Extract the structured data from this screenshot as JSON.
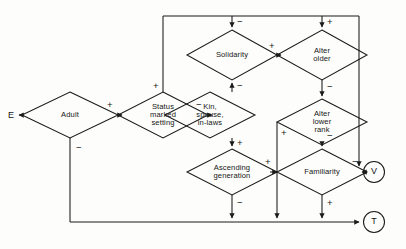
{
  "diagram": {
    "type": "signed-causal-graph",
    "stroke_color": "#1a1a1a",
    "background_color": "#fdfdfb",
    "nodes": [
      {
        "id": "adult",
        "shape": "diamond",
        "label": "Adult"
      },
      {
        "id": "status",
        "shape": "diamond",
        "label": "Status\nmarked\nsetting"
      },
      {
        "id": "kin",
        "shape": "diamond",
        "label": "Kin,\nspouse,\nin-laws"
      },
      {
        "id": "solidarity",
        "shape": "diamond",
        "label": "Solidarity"
      },
      {
        "id": "alter_older",
        "shape": "diamond",
        "label": "Alter\nolder"
      },
      {
        "id": "alter_lower",
        "shape": "diamond",
        "label": "Alter\nlower\nrank"
      },
      {
        "id": "ascending",
        "shape": "diamond",
        "label": "Ascending\ngeneration"
      },
      {
        "id": "familiarity",
        "shape": "diamond",
        "label": "Familiarity"
      }
    ],
    "terminals": [
      {
        "id": "e",
        "shape": "plain",
        "label": "E"
      },
      {
        "id": "v",
        "shape": "circle",
        "label": "V"
      },
      {
        "id": "t",
        "shape": "circle",
        "label": "T"
      }
    ],
    "edge_signs": {
      "adult_to_status": "+",
      "adult_down": "−",
      "status_to_kin": "−",
      "status_up": "+",
      "kin_to_solidarity": "−",
      "kin_to_ascending": "+",
      "solidarity_top": "−",
      "solidarity_to_alter_older": "+",
      "alter_older_top": "+",
      "alter_older_to_alter_lower": "−",
      "alter_lower_left": "+",
      "alter_lower_to_familiarity": "−",
      "ascending_to_familiarity": "+",
      "ascending_down": "−",
      "familiarity_to_v": "−",
      "familiarity_down": "+"
    }
  }
}
